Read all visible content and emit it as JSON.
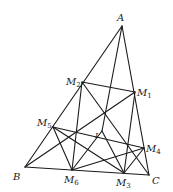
{
  "diagram": {
    "type": "geometry",
    "points": {
      "A": {
        "label": "A",
        "sub": "",
        "x": 122,
        "y": 26
      },
      "B": {
        "label": "B",
        "sub": "",
        "x": 25,
        "y": 167
      },
      "C": {
        "label": "C",
        "sub": "",
        "x": 149,
        "y": 175
      },
      "M1": {
        "label": "M",
        "sub": "1",
        "x": 135,
        "y": 92
      },
      "M2": {
        "label": "M",
        "sub": "2",
        "x": 82,
        "y": 82
      },
      "M3": {
        "label": "M",
        "sub": "3",
        "x": 124,
        "y": 173
      },
      "M4": {
        "label": "M",
        "sub": "4",
        "x": 144,
        "y": 148
      },
      "M5": {
        "label": "M",
        "sub": "5",
        "x": 53,
        "y": 127
      },
      "M6": {
        "label": "M",
        "sub": "6",
        "x": 72,
        "y": 170
      },
      "I": {
        "label": "I",
        "sub": "",
        "x": 102,
        "y": 131
      }
    },
    "labels": {
      "A": "A",
      "B": "B",
      "C": "C",
      "M": "M",
      "s1": "1",
      "s2": "2",
      "s3": "3",
      "s4": "4",
      "s5": "5",
      "s6": "6",
      "I": "I"
    },
    "stroke_color": "#1a1a1a",
    "background": "#ffffff"
  }
}
